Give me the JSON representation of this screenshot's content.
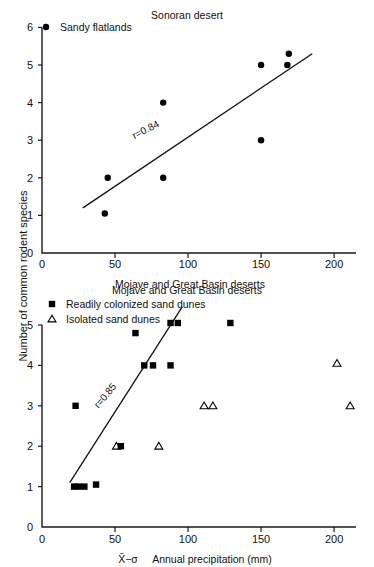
{
  "figure": {
    "y_axis_label": "Number of common rodent species"
  },
  "chart_data": [
    {
      "type": "scatter",
      "panel": "top",
      "title": "Sonoran desert",
      "xlabel": "Mojave and Great Basin deserts",
      "ylabel": "Number of common rodent species",
      "xlim": [
        0,
        215
      ],
      "ylim": [
        0,
        6
      ],
      "xticks": [
        0,
        50,
        100,
        150,
        200
      ],
      "xticklabels": [
        "0",
        "50",
        "100",
        "150",
        "200"
      ],
      "yticks": [
        0,
        1,
        2,
        3,
        4,
        5,
        6
      ],
      "yticklabels": [
        "0",
        "1",
        "2",
        "3",
        "4",
        "5",
        "6"
      ],
      "grid": false,
      "legend_position": "top-left",
      "legend": [
        {
          "label": "Sandy flatlands",
          "marker": "circle"
        }
      ],
      "annotations": [
        {
          "text": "r=0.84",
          "x": 72,
          "y": 3.2,
          "rotation": -27
        }
      ],
      "series": [
        {
          "name": "Sandy flatlands",
          "marker": "circle",
          "points": [
            {
              "x": 45,
              "y": 2.0
            },
            {
              "x": 43,
              "y": 1.05
            },
            {
              "x": 83,
              "y": 4.0
            },
            {
              "x": 83,
              "y": 2.0
            },
            {
              "x": 150,
              "y": 5.0
            },
            {
              "x": 150,
              "y": 3.0
            },
            {
              "x": 169,
              "y": 5.3
            },
            {
              "x": 168,
              "y": 5.0
            }
          ]
        }
      ],
      "fit_line": {
        "x1": 28,
        "y1": 1.2,
        "x2": 185,
        "y2": 5.3,
        "label": "r=0.84"
      }
    },
    {
      "type": "scatter",
      "panel": "bottom",
      "title": "Mojave and Great Basin deserts",
      "xlabel": "Annual precipitation (mm)",
      "xlabel_prefix": "X̄−σ",
      "ylabel": "Number of common rodent species",
      "xlim": [
        0,
        215
      ],
      "ylim": [
        0,
        5
      ],
      "xticks": [
        0,
        50,
        100,
        150,
        200
      ],
      "xticklabels": [
        "0",
        "50",
        "100",
        "150",
        "200"
      ],
      "yticks": [
        0,
        1,
        2,
        3,
        4,
        5
      ],
      "yticklabels": [
        "0",
        "1",
        "2",
        "3",
        "4",
        "5"
      ],
      "grid": false,
      "legend_position": "top-left",
      "legend": [
        {
          "label": "Readily colonized sand dunes",
          "marker": "square"
        },
        {
          "label": "Isolated sand dunes",
          "marker": "triangle"
        }
      ],
      "annotations": [
        {
          "text": "r=0.85",
          "x": 45,
          "y": 3.2,
          "rotation": -50
        }
      ],
      "series": [
        {
          "name": "Readily colonized sand dunes",
          "marker": "square",
          "points": [
            {
              "x": 22,
              "y": 1.0
            },
            {
              "x": 25,
              "y": 1.0
            },
            {
              "x": 29,
              "y": 1.0
            },
            {
              "x": 37,
              "y": 1.05
            },
            {
              "x": 23,
              "y": 3.0
            },
            {
              "x": 54,
              "y": 2.0
            },
            {
              "x": 64,
              "y": 4.8
            },
            {
              "x": 70,
              "y": 4.0
            },
            {
              "x": 76,
              "y": 4.0
            },
            {
              "x": 88,
              "y": 4.0
            },
            {
              "x": 88,
              "y": 5.05
            },
            {
              "x": 93,
              "y": 5.05
            },
            {
              "x": 129,
              "y": 5.05
            }
          ]
        },
        {
          "name": "Isolated sand dunes",
          "marker": "triangle",
          "points": [
            {
              "x": 51,
              "y": 2.0
            },
            {
              "x": 80,
              "y": 2.0
            },
            {
              "x": 111,
              "y": 3.0
            },
            {
              "x": 117,
              "y": 3.0
            },
            {
              "x": 202,
              "y": 4.05
            },
            {
              "x": 211,
              "y": 3.0
            }
          ]
        }
      ],
      "fit_line": {
        "x1": 19,
        "y1": 1.1,
        "x2": 96,
        "y2": 5.45,
        "label": "r=0.85"
      }
    }
  ]
}
